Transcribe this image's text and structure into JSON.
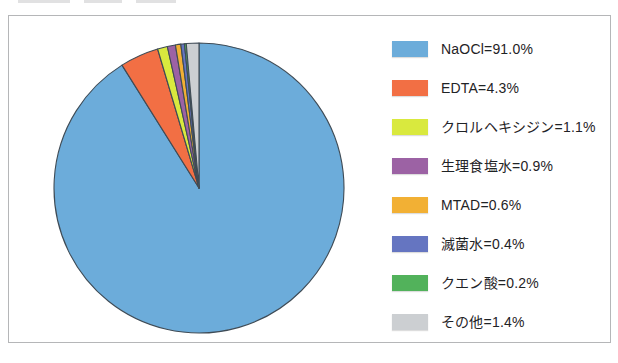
{
  "figure": {
    "background_color": "#ffffff",
    "box_border_color": "#b5b6b8"
  },
  "chart_data": {
    "type": "pie",
    "title": "",
    "legend_position": "right",
    "direction": "clockwise",
    "start_angle_deg": 0,
    "outline_color": "#3f4b55",
    "label_separator": "=",
    "value_suffix": "%",
    "slices": [
      {
        "key": "naocl",
        "label": "NaOCl",
        "value": 91.0,
        "color": "#6cacda"
      },
      {
        "key": "edta",
        "label": "EDTA",
        "value": 4.3,
        "color": "#f26f44"
      },
      {
        "key": "chlorhexidine",
        "label": "クロルヘキシジン",
        "value": 1.1,
        "color": "#d9e93e"
      },
      {
        "key": "saline",
        "label": "生理食塩水",
        "value": 0.9,
        "color": "#9c62a4"
      },
      {
        "key": "mtad",
        "label": "MTAD",
        "value": 0.6,
        "color": "#f2b034"
      },
      {
        "key": "sterile-water",
        "label": "滅菌水",
        "value": 0.4,
        "color": "#6575c1"
      },
      {
        "key": "citric-acid",
        "label": "クエン酸",
        "value": 0.2,
        "color": "#52b25b"
      },
      {
        "key": "others",
        "label": "その他",
        "value": 1.4,
        "color": "#cccfd2"
      }
    ]
  }
}
